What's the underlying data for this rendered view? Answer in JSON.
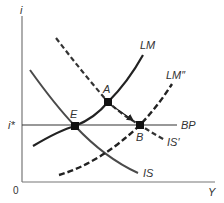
{
  "diagram": {
    "axes": {
      "y_label": "i",
      "x_label": "Y",
      "origin_label": "0",
      "rate_label": "i*"
    },
    "curves": {
      "is": "IS",
      "lm": "LM",
      "is_prime": "IS′",
      "lm_double_prime": "LM″",
      "bp": "BP"
    },
    "points": {
      "e": "E",
      "a": "A",
      "b": "B"
    },
    "colors": {
      "axis": "#777777",
      "curve": "#222222",
      "is_curve": "#4a4a4a",
      "point": "#111111"
    }
  }
}
